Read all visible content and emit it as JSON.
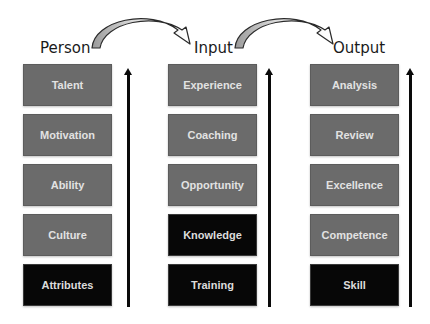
{
  "diagram": {
    "columns": [
      {
        "id": "person",
        "label": "Person",
        "items": [
          {
            "label": "Talent",
            "style": "gray"
          },
          {
            "label": "Motivation",
            "style": "gray"
          },
          {
            "label": "Ability",
            "style": "gray"
          },
          {
            "label": "Culture",
            "style": "gray"
          },
          {
            "label": "Attributes",
            "style": "black"
          }
        ]
      },
      {
        "id": "input",
        "label": "Input",
        "items": [
          {
            "label": "Experience",
            "style": "gray"
          },
          {
            "label": "Coaching",
            "style": "gray"
          },
          {
            "label": "Opportunity",
            "style": "gray"
          },
          {
            "label": "Knowledge",
            "style": "black"
          },
          {
            "label": "Training",
            "style": "black"
          }
        ]
      },
      {
        "id": "output",
        "label": "Output",
        "items": [
          {
            "label": "Analysis",
            "style": "gray"
          },
          {
            "label": "Review",
            "style": "gray"
          },
          {
            "label": "Excellence",
            "style": "gray"
          },
          {
            "label": "Competence",
            "style": "gray"
          },
          {
            "label": "Skill",
            "style": "black"
          }
        ]
      }
    ],
    "connectors": [
      {
        "from": "Person",
        "to": "Input",
        "type": "curved-arrow"
      },
      {
        "from": "Input",
        "to": "Output",
        "type": "curved-arrow"
      }
    ],
    "colors": {
      "gray_box": "#6b6b6b",
      "black_box": "#070707",
      "box_text": "#e2e2e2",
      "arrow": "#0a0a0a"
    }
  }
}
